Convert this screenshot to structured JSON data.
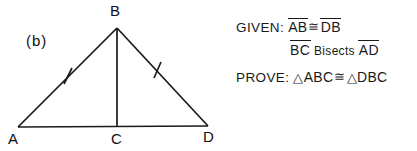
{
  "figure": {
    "part_label": "(b)",
    "vertices": [
      {
        "name": "B",
        "label": "B",
        "x": 117,
        "y": 28
      },
      {
        "name": "A",
        "label": "A",
        "x": 18,
        "y": 127
      },
      {
        "name": "C",
        "label": "C",
        "x": 117,
        "y": 127
      },
      {
        "name": "D",
        "label": "D",
        "x": 208,
        "y": 126
      }
    ],
    "segments": [
      "AB",
      "BD",
      "AD",
      "BC"
    ],
    "tick_marks": [
      {
        "on_segment": "AB",
        "count": 1
      },
      {
        "on_segment": "BD",
        "count": 1
      }
    ]
  },
  "statements": {
    "given_keyword": "GIVEN:",
    "prove_keyword": "PROVE:",
    "congruent_symbol": "≅",
    "triangle_symbol": "△",
    "given": {
      "line1": {
        "left_segment": "AB",
        "relation": "≅",
        "right_segment": "DB"
      },
      "line2": {
        "segment": "BC",
        "verb": "Bisects",
        "target_segment": "AD"
      }
    },
    "prove": {
      "left_triangle": "ABC",
      "relation": "≅",
      "right_triangle": "DBC"
    }
  },
  "colors": {
    "ink": "#1a1a1a",
    "background": "#ffffff"
  }
}
